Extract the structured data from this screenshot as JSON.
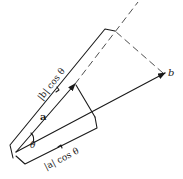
{
  "diagram": {
    "labels": {
      "vector_a": "a",
      "vector_b": "b",
      "angle": "θ",
      "proj_b_on_a": "|b| cos θ",
      "proj_a_on_b": "|a| cos θ"
    },
    "colors": {
      "ink": "#1a1a1a",
      "background": "#ffffff"
    }
  }
}
